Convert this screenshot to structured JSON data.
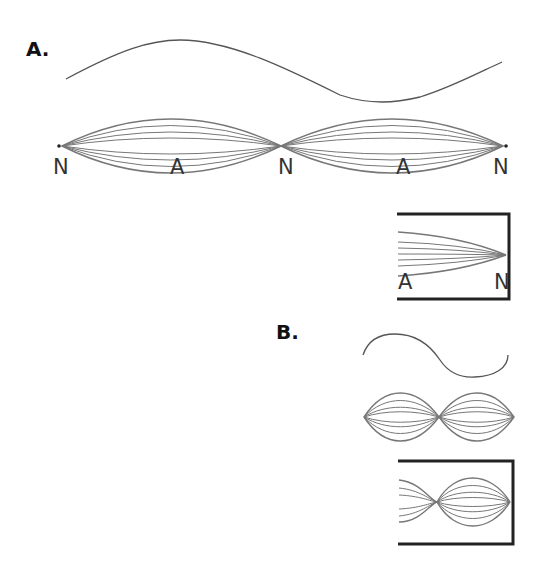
{
  "panels": {
    "a": {
      "label": "A.",
      "node_labels": [
        "N",
        "A",
        "N",
        "A",
        "N"
      ],
      "closed_end": {
        "labels": [
          "A",
          "N"
        ]
      }
    },
    "b": {
      "label": "B."
    }
  },
  "colors": {
    "curve": "#555555",
    "envelope": "#777777",
    "frame": "#222222",
    "text": "#222222"
  }
}
